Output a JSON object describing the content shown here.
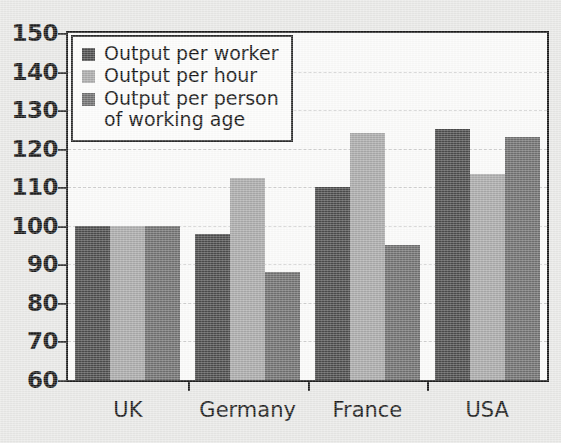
{
  "chart_data": {
    "type": "bar",
    "title": "",
    "subtitle": "",
    "xlabel": "",
    "ylabel": "",
    "categories": [
      "UK",
      "Germany",
      "France",
      "USA"
    ],
    "series": [
      {
        "name": "Output per worker",
        "color": "#4c4c4c",
        "values": [
          100,
          98,
          110,
          125
        ]
      },
      {
        "name": "Output per hour",
        "color": "#a9a9a9",
        "values": [
          100,
          112.5,
          124,
          113.5
        ]
      },
      {
        "name": "Output per person\nof working age",
        "color": "#6f6f6f",
        "values": [
          100,
          88,
          95,
          123
        ]
      }
    ],
    "ylim": [
      60,
      150
    ],
    "ytick_step": 10,
    "yticks": [
      150,
      140,
      130,
      120,
      110,
      100,
      90,
      80,
      70,
      60
    ],
    "ytick_labels": [
      "150",
      "140",
      "130",
      "120",
      "110",
      "100",
      "90",
      "80",
      "70",
      "60"
    ],
    "grid": true,
    "grid_axis": "y",
    "grid_style": "dashed",
    "legend_position": "upper-left-inside",
    "bar_layout": "grouped",
    "baseline": 60
  },
  "legend": {
    "items": [
      {
        "label": "Output per worker",
        "swatch": "#4c4c4c"
      },
      {
        "label": "Output per hour",
        "swatch": "#a9a9a9"
      },
      {
        "label": "Output per person\nof working age",
        "swatch": "#6f6f6f"
      }
    ]
  },
  "colors": {
    "series_dark": "#4c4c4c",
    "series_light": "#a9a9a9",
    "series_medium": "#6f6f6f",
    "axis": "#1c1c1c",
    "grid": "#cfcfcf",
    "plot_background": "#fbfbfa",
    "page_background": "#e9e9e7",
    "text": "#1a1a1a"
  }
}
